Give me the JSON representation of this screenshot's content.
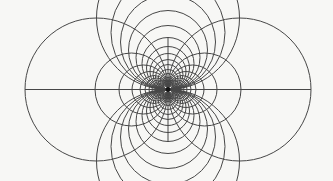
{
  "canvas": {
    "width": 333,
    "height": 181,
    "background_color": "#f7f7f5"
  },
  "diagram": {
    "type": "tangent-circle-grid-inversion-figure",
    "stroke_color": "#474747",
    "stroke_width": 1,
    "pole": {
      "x": 168,
      "y": 89.5
    },
    "pole_dot": {
      "radius": 2.4,
      "fill": "#141414"
    },
    "axis_segments": {
      "horizontal": {
        "x1": 25,
        "x2": 311,
        "y": 89.5
      },
      "vertical": {
        "x": 168,
        "y1": 37,
        "y2": 142
      }
    },
    "circle_families": {
      "horizontal_tangent_diameters": [
        143,
        73,
        49,
        36,
        28,
        23,
        19,
        16,
        13,
        11,
        9,
        7
      ],
      "horizontal_sides": [
        "left",
        "right"
      ],
      "vertical_tangent_diameters": [
        143,
        114,
        95,
        79,
        64,
        52,
        43,
        36,
        30,
        25,
        20,
        16,
        12,
        9
      ],
      "vertical_sides": [
        "up",
        "down"
      ]
    }
  }
}
